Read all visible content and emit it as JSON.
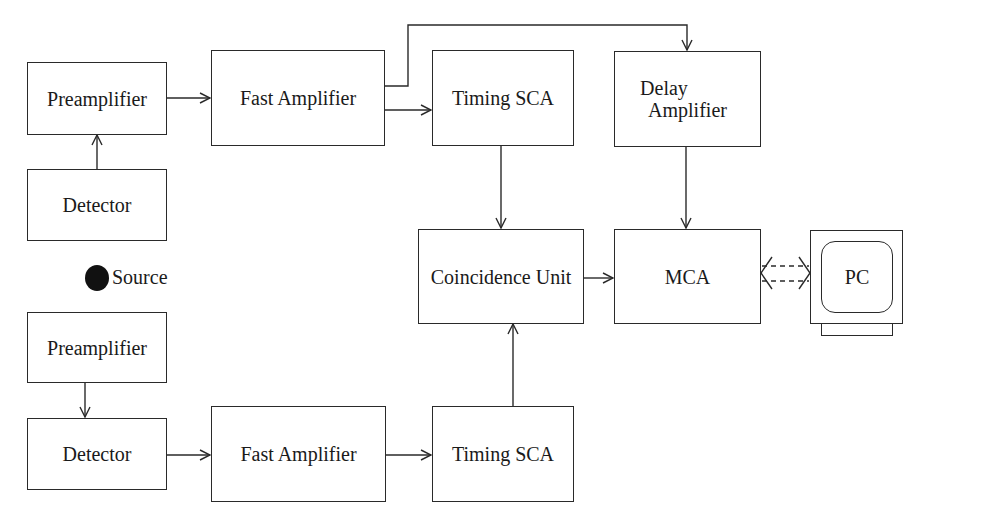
{
  "diagram": {
    "type": "block-diagram",
    "title": "",
    "blocks": {
      "preamp_top": {
        "label": "Preamplifier"
      },
      "detector_top": {
        "label": "Detector"
      },
      "fast_amp_top": {
        "label": "Fast Amplifier"
      },
      "timing_sca_top": {
        "label": "Timing SCA"
      },
      "delay_amp": {
        "line1": "Delay",
        "line2": "Amplifier"
      },
      "coincidence": {
        "label": "Coincidence Unit"
      },
      "mca": {
        "label": "MCA"
      },
      "pc": {
        "label": "PC"
      },
      "preamp_bottom": {
        "label": "Preamplifier"
      },
      "detector_bottom": {
        "label": "Detector"
      },
      "fast_amp_bottom": {
        "label": "Fast Amplifier"
      },
      "timing_sca_bottom": {
        "label": "Timing SCA"
      }
    },
    "source": {
      "label": "Source"
    },
    "connections": [
      {
        "from": "Detector (top)",
        "to": "Preamplifier (top)"
      },
      {
        "from": "Preamplifier (top)",
        "to": "Fast Amplifier (top)"
      },
      {
        "from": "Fast Amplifier (top)",
        "to": "Timing SCA (top)"
      },
      {
        "from": "Fast Amplifier (top)",
        "to": "Delay Amplifier"
      },
      {
        "from": "Timing SCA (top)",
        "to": "Coincidence Unit"
      },
      {
        "from": "Delay Amplifier",
        "to": "MCA"
      },
      {
        "from": "Coincidence Unit",
        "to": "MCA"
      },
      {
        "from": "MCA",
        "to": "PC",
        "style": "dashed-bidirectional"
      },
      {
        "from": "Preamplifier (bottom)",
        "to": "Detector (bottom)"
      },
      {
        "from": "Detector (bottom)",
        "to": "Fast Amplifier (bottom)"
      },
      {
        "from": "Fast Amplifier (bottom)",
        "to": "Timing SCA (bottom)"
      },
      {
        "from": "Timing SCA (bottom)",
        "to": "Coincidence Unit"
      }
    ]
  }
}
